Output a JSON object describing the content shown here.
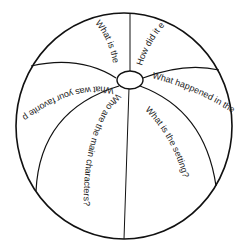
{
  "beach_ball": {
    "line_color": "#111111",
    "background": "#ffffff",
    "questions": [
      {
        "id": "top-left",
        "text": "What is the"
      },
      {
        "id": "top-right",
        "text": "How did it e"
      },
      {
        "id": "left",
        "text": "What was your favorite par"
      },
      {
        "id": "right",
        "text": "What happened in the"
      },
      {
        "id": "bottom-left",
        "text": "Who are the main characters?"
      },
      {
        "id": "bottom-right",
        "text": "What is the setting?"
      }
    ]
  }
}
